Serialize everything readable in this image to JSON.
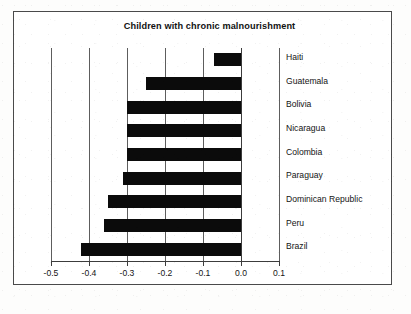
{
  "chart_data": {
    "type": "bar",
    "orientation": "horizontal",
    "title": "Children with chronic malnourishment",
    "xlabel": "",
    "ylabel": "",
    "categories": [
      "Haiti",
      "Guatemala",
      "Bolivia",
      "Nicaragua",
      "Colombia",
      "Paraguay",
      "Dominican Republic",
      "Peru",
      "Brazil"
    ],
    "values": [
      -0.07,
      -0.25,
      -0.3,
      -0.3,
      -0.3,
      -0.31,
      -0.35,
      -0.36,
      -0.42
    ],
    "xlim": [
      -0.5,
      0.1
    ],
    "xticks": [
      -0.5,
      -0.4,
      -0.3,
      -0.2,
      -0.1,
      0.0,
      0.1
    ],
    "xticklabels": [
      "-0.5",
      "-0.4",
      "-0.3",
      "-0.2",
      "-0.1",
      "0.0",
      "0.1"
    ],
    "grid": true,
    "grid_axis": "x",
    "legend": false,
    "bar_color": "#0b0b0b",
    "gridline_color": "#5d5d5d",
    "frame_color": "#4a4a4a",
    "background": "#ffffff"
  },
  "chart": {
    "title": "Children with chronic malnourishment"
  }
}
